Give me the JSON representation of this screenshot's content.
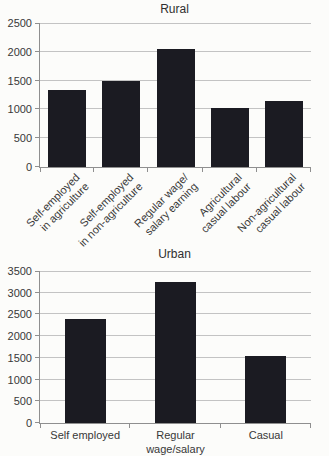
{
  "page": {
    "background": "#fcfcfa",
    "text_color": "#3a3a3a"
  },
  "chart_data": [
    {
      "type": "bar",
      "title": "Rural",
      "categories": [
        [
          "Self-employed",
          "in agriculture"
        ],
        [
          "Self-employed",
          "in non-agriculture"
        ],
        [
          "Regular wage/",
          "salary earning"
        ],
        [
          "Agricultural",
          "casual labour"
        ],
        [
          "Non-agricultural",
          "casual labour"
        ]
      ],
      "values": [
        1340,
        1500,
        2050,
        1020,
        1150
      ],
      "xlabel": "",
      "ylabel": "",
      "ylim": [
        0,
        2500
      ],
      "ytick_step": 500,
      "grid": true,
      "legend": false,
      "bar_color": "#1b1b22",
      "bar_width_px": 38,
      "label_rotation": -45
    },
    {
      "type": "bar",
      "title": "Urban",
      "categories": [
        [
          "Self employed"
        ],
        [
          "Regular",
          "wage/salary"
        ],
        [
          "Casual"
        ]
      ],
      "values": [
        2400,
        3250,
        1550
      ],
      "xlabel": "",
      "ylabel": "",
      "ylim": [
        0,
        3500
      ],
      "ytick_step": 500,
      "grid": true,
      "legend": false,
      "bar_color": "#1b1b22",
      "bar_width_px": 41,
      "label_rotation": 0
    }
  ]
}
